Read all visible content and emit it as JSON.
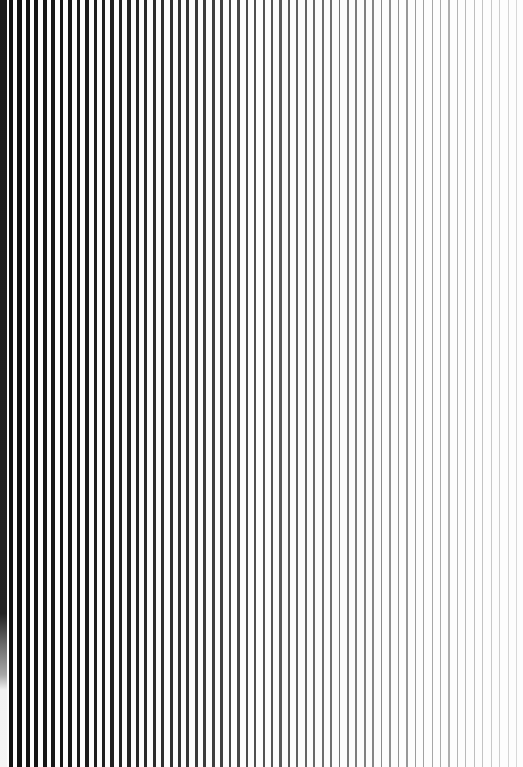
{
  "pattern": {
    "type": "vertical-line-gradient",
    "width": 523,
    "height": 767,
    "background": "#fdfdfd",
    "line_count": 61,
    "start_x": 9,
    "period_px": 8.45,
    "thickness_start_px": 4.2,
    "thickness_end_px": 0.8,
    "color_start": "#111111",
    "color_end": "#d8d8d8"
  },
  "edge_band": {
    "width_px": 7,
    "gradient": [
      {
        "stop": 0,
        "color": "#1a1a1a"
      },
      {
        "stop": 0.8,
        "color": "#222222"
      },
      {
        "stop": 0.84,
        "color": "#6a6a6a"
      },
      {
        "stop": 0.88,
        "color": "#a8a8a8"
      },
      {
        "stop": 0.9,
        "color": "#f2f2f2"
      },
      {
        "stop": 1,
        "color": "#f5f5f5"
      }
    ]
  }
}
